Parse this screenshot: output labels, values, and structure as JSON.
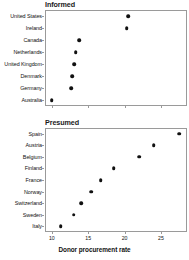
{
  "figure": {
    "xlabel": "Donor procurement rate",
    "axis_color": "#9a9a9a",
    "dot_color": "#111111",
    "background": "#ffffff"
  },
  "chart_data": [
    {
      "type": "scatter",
      "title": "Informed",
      "panel_index": 0,
      "xlabel": "",
      "ylabel": "",
      "xlim": [
        9.0,
        28.5
      ],
      "grid": false,
      "legend": null,
      "xticks": [
        10,
        15,
        20,
        25
      ],
      "xtick_labels_visible": false,
      "categories": [
        "United States",
        "Ireland",
        "Canada",
        "Netherlands",
        "United Kingdom",
        "Denmark",
        "Germany",
        "Australia"
      ],
      "values": [
        20.5,
        20.3,
        13.8,
        13.3,
        13.1,
        12.8,
        12.7,
        10.0
      ]
    },
    {
      "type": "scatter",
      "title": "Presumed",
      "panel_index": 1,
      "xlabel": "Donor procurement rate",
      "ylabel": "",
      "xlim": [
        9.0,
        28.5
      ],
      "grid": false,
      "legend": null,
      "xticks": [
        10,
        15,
        20,
        25
      ],
      "xtick_labels_visible": true,
      "categories": [
        "Spain",
        "Austria",
        "Belgium",
        "Finland",
        "France",
        "Norway",
        "Switzerland",
        "Sweden",
        "Italy"
      ],
      "values": [
        27.5,
        24.0,
        22.0,
        18.5,
        16.7,
        15.4,
        14.0,
        13.0,
        11.2
      ]
    }
  ]
}
